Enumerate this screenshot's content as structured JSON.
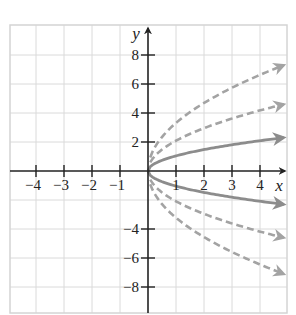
{
  "chart_data": {
    "type": "line",
    "title": "",
    "xlabel": "x",
    "ylabel": "y",
    "xlim": [
      -5,
      5
    ],
    "ylim": [
      -10,
      10
    ],
    "grid": true,
    "x_ticks": [
      -4,
      -3,
      -2,
      -1,
      1,
      2,
      3,
      4
    ],
    "x_tick_labels": [
      "−4",
      "−3",
      "−2",
      "−1",
      "1",
      "2",
      "3",
      "4"
    ],
    "y_ticks": [
      -8,
      -6,
      -4,
      2,
      4,
      6,
      8
    ],
    "y_tick_labels": [
      "−8",
      "−6",
      "−4",
      "2",
      "4",
      "6",
      "8"
    ],
    "x": [
      0,
      0.25,
      0.5,
      1,
      1.5,
      2,
      2.5,
      3,
      3.5,
      4,
      4.5,
      5
    ],
    "series": [
      {
        "name": "y = 3√x",
        "style": "dashed",
        "color": "#a3a3a3",
        "values": [
          0,
          1.5,
          2.12,
          3,
          3.67,
          4.24,
          4.74,
          5.2,
          5.61,
          6,
          6.36,
          6.71
        ]
      },
      {
        "name": "y = 2√x",
        "style": "dashed",
        "color": "#a3a3a3",
        "values": [
          0,
          1,
          1.41,
          2,
          2.45,
          2.83,
          3.16,
          3.46,
          3.74,
          4,
          4.24,
          4.47
        ]
      },
      {
        "name": "y = √x",
        "style": "solid",
        "color": "#8c8c8c",
        "values": [
          0,
          0.5,
          0.71,
          1,
          1.22,
          1.41,
          1.58,
          1.73,
          1.87,
          2,
          2.12,
          2.24
        ]
      },
      {
        "name": "y = −√x",
        "style": "solid",
        "color": "#8c8c8c",
        "values": [
          0,
          -0.5,
          -0.71,
          -1,
          -1.22,
          -1.41,
          -1.58,
          -1.73,
          -1.87,
          -2,
          -2.12,
          -2.24
        ]
      },
      {
        "name": "y = −2√x",
        "style": "dashed",
        "color": "#a3a3a3",
        "values": [
          0,
          -1,
          -1.41,
          -2,
          -2.45,
          -2.83,
          -3.16,
          -3.46,
          -3.74,
          -4,
          -4.24,
          -4.47
        ]
      },
      {
        "name": "y = −3√x",
        "style": "dashed",
        "color": "#a3a3a3",
        "values": [
          0,
          -1.5,
          -2.12,
          -3,
          -3.67,
          -4.24,
          -4.74,
          -5.2,
          -5.61,
          -6,
          -6.36,
          -6.71
        ]
      }
    ]
  },
  "axes": {
    "x_label": "x",
    "y_label": "y"
  }
}
